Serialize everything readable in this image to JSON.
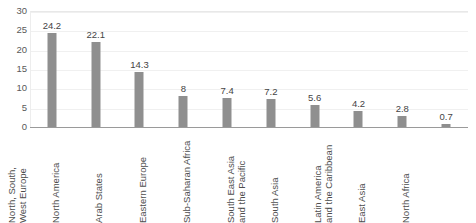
{
  "chart_data": {
    "type": "bar",
    "title": "",
    "xlabel": "",
    "ylabel": "",
    "ylim": [
      0,
      30
    ],
    "yticks": [
      0,
      5,
      10,
      15,
      20,
      25,
      30
    ],
    "grid": true,
    "legend": false,
    "orientation": "vertical",
    "bar_color": "#8f8f8f",
    "value_labels": true,
    "xtick_rotation": 90,
    "categories": [
      "North, South, West Europe",
      "North America",
      "Arab States",
      "Eastern Europe",
      "Sub-Saharan Africa",
      "South East Asia and the Pacific",
      "South Asia",
      "Latin America and the Caribbean",
      "East Asia",
      "North Africa"
    ],
    "category_lines": [
      [
        "North, South,",
        "West Europe"
      ],
      [
        "North America"
      ],
      [
        "Arab States"
      ],
      [
        "Eastern Europe"
      ],
      [
        "Sub-Saharan Africa"
      ],
      [
        "South East Asia",
        "and the Pacific"
      ],
      [
        "South Asia"
      ],
      [
        "Latin America",
        "and the Caribbean"
      ],
      [
        "East Asia"
      ],
      [
        "North Africa"
      ]
    ],
    "values": [
      24.2,
      22.1,
      14.3,
      8,
      7.4,
      7.2,
      5.6,
      4.2,
      2.8,
      0.7
    ],
    "value_label_text": [
      "24.2",
      "22.1",
      "14.3",
      "8",
      "7.4",
      "7.2",
      "5.6",
      "4.2",
      "2.8",
      "0.7"
    ]
  },
  "axis": {
    "y_tick_labels": [
      "0",
      "5",
      "10",
      "15",
      "20",
      "25",
      "30"
    ]
  },
  "colors": {
    "bar": "#8f8f8f",
    "gridline": "#f0f0f0",
    "axis": "#9a9a9a",
    "tick_text": "#595959",
    "label_text": "#4d4d4d",
    "value_text": "#444444",
    "background": "#ffffff"
  }
}
